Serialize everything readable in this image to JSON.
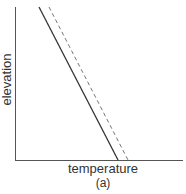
{
  "figure": {
    "caption": "(a)",
    "xlabel": "temperature",
    "ylabel": "elevation"
  },
  "diagram": {
    "type": "line",
    "elements": [
      {
        "name": "solid-line",
        "style": "solid",
        "from": "upper-left",
        "to": "lower-right"
      },
      {
        "name": "dashed-line",
        "style": "dashed",
        "from": "upper-left",
        "to": "lower-right",
        "offset": "right of solid line"
      }
    ],
    "colors": {
      "axis": "#555555",
      "solid": "#333333",
      "dashed": "#777777"
    }
  }
}
